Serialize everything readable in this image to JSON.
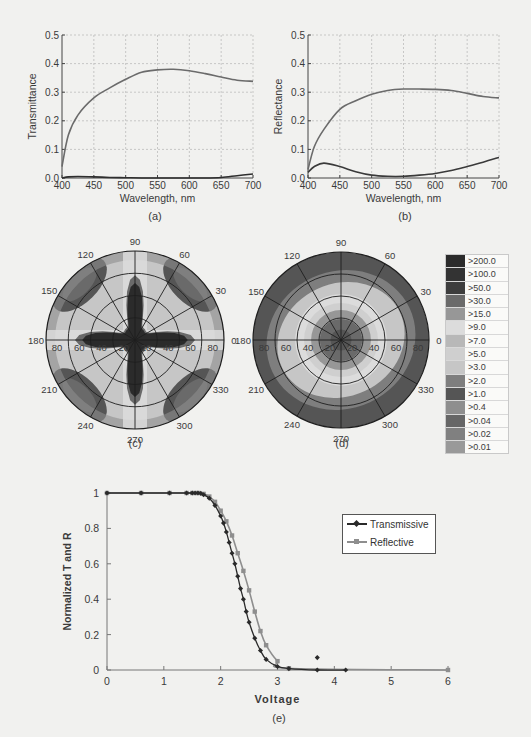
{
  "captions": {
    "a": "(a)",
    "b": "(b)",
    "c": "(c)",
    "d": "(d)",
    "e": "(e)"
  },
  "chart_data": [
    {
      "id": "a",
      "type": "line",
      "title": "",
      "xlabel": "Wavelength, nm",
      "ylabel": "Transmittance",
      "xlim": [
        400,
        700
      ],
      "ylim": [
        0,
        0.5
      ],
      "xticks": [
        400,
        450,
        500,
        550,
        600,
        650,
        700
      ],
      "yticks": [
        "0.0",
        "0.1",
        "0.2",
        "0.3",
        "0.4",
        "0.5"
      ],
      "grid": true,
      "x": [
        400,
        410,
        425,
        450,
        475,
        500,
        525,
        550,
        575,
        600,
        625,
        650,
        675,
        700
      ],
      "series": [
        {
          "name": "upper",
          "values": [
            0.04,
            0.15,
            0.22,
            0.28,
            0.315,
            0.345,
            0.37,
            0.378,
            0.38,
            0.375,
            0.365,
            0.353,
            0.342,
            0.338
          ]
        },
        {
          "name": "lower",
          "values": [
            0.0,
            0.004,
            0.005,
            0.004,
            0.002,
            0.001,
            0.0,
            0.0,
            0.0,
            0.0,
            0.0,
            0.002,
            0.008,
            0.014
          ]
        }
      ]
    },
    {
      "id": "b",
      "type": "line",
      "title": "",
      "xlabel": "Wavelength, nm",
      "ylabel": "Reflectance",
      "xlim": [
        400,
        700
      ],
      "ylim": [
        0,
        0.5
      ],
      "xticks": [
        400,
        450,
        500,
        550,
        600,
        650,
        700
      ],
      "yticks": [
        "0.0",
        "0.1",
        "0.2",
        "0.3",
        "0.4",
        "0.5"
      ],
      "grid": true,
      "x": [
        400,
        410,
        425,
        450,
        475,
        500,
        525,
        550,
        575,
        600,
        625,
        650,
        675,
        700
      ],
      "series": [
        {
          "name": "upper",
          "values": [
            0.03,
            0.11,
            0.17,
            0.24,
            0.27,
            0.293,
            0.306,
            0.311,
            0.311,
            0.31,
            0.306,
            0.296,
            0.285,
            0.28
          ]
        },
        {
          "name": "lower",
          "values": [
            0.02,
            0.04,
            0.052,
            0.04,
            0.022,
            0.01,
            0.006,
            0.006,
            0.01,
            0.016,
            0.026,
            0.04,
            0.055,
            0.072
          ]
        }
      ]
    },
    {
      "id": "c",
      "type": "heatmap",
      "subtype": "polar-contour",
      "angle_labels": [
        "0",
        "30",
        "60",
        "90",
        "120",
        "150",
        "180",
        "210",
        "240",
        "270",
        "300",
        "330"
      ],
      "radial_labels": [
        "20",
        "40",
        "60",
        "80"
      ],
      "pattern": "four-armed dark star (high contrast) along 0/90/180/270 axes"
    },
    {
      "id": "d",
      "type": "heatmap",
      "subtype": "polar-contour",
      "angle_labels": [
        "0",
        "30",
        "60",
        "90",
        "120",
        "150",
        "180",
        "210",
        "240",
        "270",
        "300",
        "330"
      ],
      "radial_labels": [
        "20",
        "40",
        "60",
        "80"
      ],
      "pattern": "concentric rings, dark center, dark outer band"
    },
    {
      "id": "cd_legend",
      "type": "table",
      "legend_title": "",
      "levels": [
        ">200.0",
        ">100.0",
        ">50.0",
        ">30.0",
        ">15.0",
        ">9.0",
        ">7.0",
        ">5.0",
        ">3.0",
        ">2.0",
        ">1.0",
        ">0.4",
        ">0.04",
        ">0.02",
        ">0.01"
      ],
      "colors": [
        "#2b2b2b",
        "#333333",
        "#3d3d3d",
        "#6a6a6a",
        "#979797",
        "#dcdcdc",
        "#b8b8b8",
        "#cfcfcf",
        "#c6c6c6",
        "#7e7e7e",
        "#555555",
        "#8e8e8e",
        "#666666",
        "#808080",
        "#999999"
      ]
    },
    {
      "id": "e",
      "type": "line",
      "title": "",
      "xlabel": "Voltage",
      "ylabel": "Normalized T and R",
      "xlim": [
        0,
        6
      ],
      "ylim": [
        0,
        1
      ],
      "xticks": [
        "0",
        "1",
        "2",
        "3",
        "4",
        "5",
        "6"
      ],
      "yticks": [
        "0",
        "0.2",
        "0.4",
        "0.6",
        "0.8",
        "1"
      ],
      "grid": false,
      "legend_position": "upper right",
      "series": [
        {
          "name": "Transmissive",
          "x": [
            0,
            0.6,
            1.1,
            1.4,
            1.5,
            1.55,
            1.6,
            1.65,
            1.7,
            1.8,
            1.9,
            2.0,
            2.05,
            2.1,
            2.15,
            2.2,
            2.25,
            2.3,
            2.35,
            2.4,
            2.45,
            2.5,
            2.6,
            2.7,
            2.8,
            3.0,
            3.2,
            3.7,
            3.7,
            4.2
          ],
          "values": [
            1,
            1,
            1,
            1,
            1,
            1,
            1,
            0.998,
            0.99,
            0.97,
            0.93,
            0.87,
            0.83,
            0.78,
            0.72,
            0.66,
            0.6,
            0.53,
            0.46,
            0.4,
            0.33,
            0.27,
            0.18,
            0.11,
            0.06,
            0.02,
            0.008,
            0.0,
            0.07,
            0.0
          ]
        },
        {
          "name": "Reflective",
          "x": [
            0,
            0.6,
            1.1,
            1.4,
            1.5,
            1.6,
            1.7,
            1.8,
            1.9,
            2.0,
            2.1,
            2.2,
            2.3,
            2.4,
            2.5,
            2.6,
            2.7,
            2.8,
            3.0,
            3.2,
            6.0
          ],
          "values": [
            1,
            1,
            1,
            1,
            1,
            1,
            0.995,
            0.98,
            0.95,
            0.9,
            0.84,
            0.76,
            0.66,
            0.56,
            0.45,
            0.33,
            0.22,
            0.14,
            0.05,
            0.01,
            0.0
          ]
        }
      ]
    }
  ],
  "legend_e": {
    "transmissive_label": "Transmissive",
    "reflective_label": "Reflective"
  }
}
